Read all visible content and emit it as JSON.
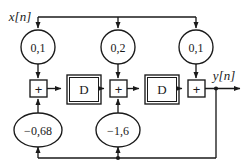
{
  "figure": {
    "type": "signal-flow-block-diagram",
    "stroke_color": "#1a1a1a",
    "fill_color": "#ffffff",
    "background": "#ffffff"
  },
  "signals": {
    "input_label": "x[n]",
    "output_label": "y[n]"
  },
  "feedforward_coefficients": [
    {
      "id": "b0",
      "label": "0,1"
    },
    {
      "id": "b1",
      "label": "0,2"
    },
    {
      "id": "b2",
      "label": "0,1"
    }
  ],
  "feedback_coefficients": [
    {
      "id": "a1",
      "label": "−0,68"
    },
    {
      "id": "a2",
      "label": "−1,6"
    }
  ],
  "delays": [
    {
      "id": "d1",
      "label": "D"
    },
    {
      "id": "d2",
      "label": "D"
    }
  ],
  "adders": [
    {
      "id": "sum1",
      "label": "+"
    },
    {
      "id": "sum2",
      "label": "+"
    },
    {
      "id": "sum3",
      "label": "+"
    }
  ]
}
